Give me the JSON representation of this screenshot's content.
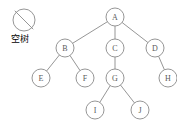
{
  "figure": {
    "background_color": "#ffffff",
    "stroke_color": "#8a8a8a",
    "text_color": "#555555"
  },
  "legend": {
    "symbol_name": "empty-set-icon",
    "caption": "空树",
    "cx": 24,
    "cy": 20,
    "r": 11
  },
  "chart_data": {
    "type": "diagram",
    "subtype": "rooted-tree",
    "title": "",
    "node_radius": 9,
    "nodes": [
      {
        "id": "A",
        "label": "A",
        "x": 115,
        "y": 17
      },
      {
        "id": "B",
        "label": "B",
        "x": 65,
        "y": 48
      },
      {
        "id": "C",
        "label": "C",
        "x": 115,
        "y": 48
      },
      {
        "id": "D",
        "label": "D",
        "x": 155,
        "y": 48
      },
      {
        "id": "E",
        "label": "E",
        "x": 41,
        "y": 78
      },
      {
        "id": "F",
        "label": "F",
        "x": 85,
        "y": 78
      },
      {
        "id": "G",
        "label": "G",
        "x": 115,
        "y": 78
      },
      {
        "id": "H",
        "label": "H",
        "x": 168,
        "y": 78
      },
      {
        "id": "I",
        "label": "I",
        "x": 95,
        "y": 110
      },
      {
        "id": "J",
        "label": "J",
        "x": 140,
        "y": 110
      }
    ],
    "edges": [
      {
        "from": "A",
        "to": "B"
      },
      {
        "from": "A",
        "to": "C"
      },
      {
        "from": "A",
        "to": "D"
      },
      {
        "from": "B",
        "to": "E"
      },
      {
        "from": "B",
        "to": "F"
      },
      {
        "from": "C",
        "to": "G"
      },
      {
        "from": "D",
        "to": "H"
      },
      {
        "from": "G",
        "to": "I"
      },
      {
        "from": "G",
        "to": "J"
      }
    ],
    "root": "A",
    "leaves": [
      "E",
      "F",
      "H",
      "I",
      "J"
    ]
  }
}
